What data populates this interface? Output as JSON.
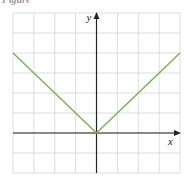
{
  "caption": "Figure",
  "chart_data": {
    "type": "line",
    "title": "",
    "xlabel": "x",
    "ylabel": "y",
    "xlim": [
      -4,
      4
    ],
    "ylim": [
      -2,
      6
    ],
    "grid": true,
    "series": [
      {
        "name": "y = |x|",
        "color": "#7ab55c",
        "x": [
          -4,
          0,
          4
        ],
        "y": [
          4,
          0,
          4
        ]
      }
    ]
  }
}
